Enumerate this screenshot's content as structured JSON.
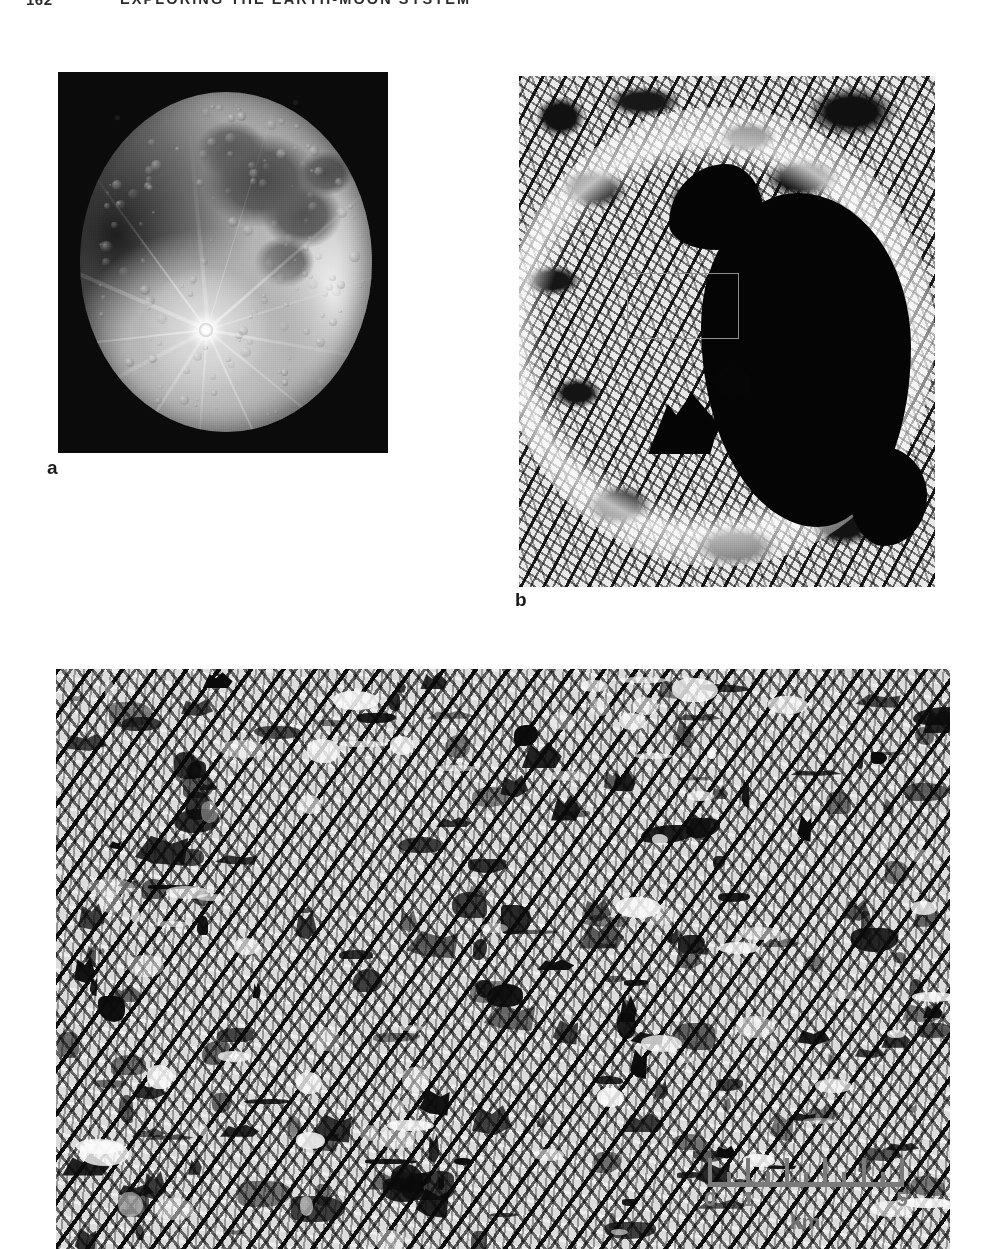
{
  "page": {
    "folio": "162",
    "running_head": "EXPLORING THE EARTH-MOON SYSTEM"
  },
  "figure": {
    "panels": [
      {
        "id": "a",
        "label": "a",
        "kind": "photograph",
        "subject": "full-moon-telescopic-view",
        "description": "Telescopic photograph of the full Moon on a black sky, showing dark maria in the upper hemisphere and the bright ray system of the crater Tycho radiating from the lower centre.",
        "background_color": "#0b0b0b"
      },
      {
        "id": "b",
        "label": "b",
        "kind": "photograph",
        "subject": "tycho-crater-orbital-view",
        "description": "High-contrast spacecraft image of the crater Tycho; the eastern half of the crater floor lies in deep black shadow and a thin grey rectangle outlines the area enlarged in panel c.",
        "inset_box": true,
        "background_color": "#e8e8e8"
      },
      {
        "id": "c",
        "label": "c",
        "kind": "photograph",
        "subject": "tycho-crater-floor-closeup",
        "description": "Close-up of the rubbly, blocky floor of Tycho showing hummocky debris, boulders and dark shadows cast by low sunlight.",
        "background_color": "#dcdcdc"
      }
    ]
  },
  "scale_bar": {
    "unit": "km",
    "tick_labels": [
      "0",
      "1",
      "2",
      "3",
      "4",
      "5"
    ],
    "labels_shown": [
      "0",
      "1",
      "5"
    ],
    "min": 0,
    "max": 5,
    "color": "#7a7a7a"
  }
}
